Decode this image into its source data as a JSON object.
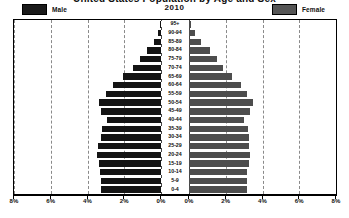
{
  "chart_data": {
    "type": "bar",
    "subtype": "population-pyramid",
    "title": "United States Population by Age and Sex",
    "year_label": "2010",
    "categories": [
      "95+",
      "90-94",
      "85-89",
      "80-84",
      "75-79",
      "70-74",
      "65-69",
      "60-64",
      "55-59",
      "50-54",
      "45-49",
      "40-44",
      "35-39",
      "30-34",
      "25-29",
      "20-24",
      "15-19",
      "10-14",
      "5-9",
      "0-4"
    ],
    "series": [
      {
        "name": "Male",
        "color": "#141414",
        "side": "left",
        "values": [
          0.03,
          0.14,
          0.39,
          0.77,
          1.14,
          1.52,
          2.09,
          2.62,
          2.99,
          3.35,
          3.24,
          2.96,
          3.2,
          3.28,
          3.41,
          3.47,
          3.4,
          3.32,
          3.28,
          3.27
        ]
      },
      {
        "name": "Female",
        "color": "#4d4d4d",
        "side": "right",
        "values": [
          0.09,
          0.3,
          0.68,
          1.17,
          1.53,
          1.84,
          2.36,
          2.85,
          3.16,
          3.48,
          3.33,
          3.02,
          3.21,
          3.24,
          3.28,
          3.3,
          3.24,
          3.17,
          3.14,
          3.13
        ]
      }
    ],
    "xlabel": "",
    "ylabel": "",
    "xlim_left": [
      8,
      0
    ],
    "xlim_right": [
      0,
      8
    ],
    "xtick_labels_left": [
      "8%",
      "6%",
      "4%",
      "2%",
      "0%"
    ],
    "xtick_labels_right": [
      "0%",
      "2%",
      "4%",
      "6%",
      "8%"
    ],
    "xtick_values": [
      8,
      6,
      4,
      2,
      0,
      0,
      2,
      4,
      6,
      8
    ],
    "grid": true,
    "grid_style": "dashed",
    "legend_position": "top"
  },
  "legend": {
    "male_label": "Male",
    "female_label": "Female",
    "year": "2010"
  }
}
